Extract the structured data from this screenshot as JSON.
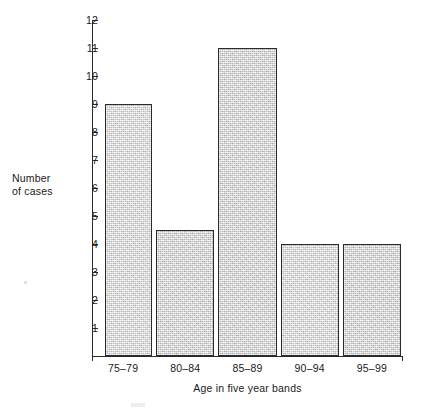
{
  "chart_data": {
    "type": "bar",
    "title": "",
    "subtitle": "",
    "xlabel": "Age in five year bands",
    "ylabel": "Number of cases",
    "ylabel_lines": [
      "Number",
      "of cases"
    ],
    "categories": [
      "75–79",
      "80–84",
      "85–89",
      "90–94",
      "95–99"
    ],
    "values": [
      9,
      4.5,
      11,
      4,
      4
    ],
    "ylim": [
      0,
      12
    ],
    "ytick_labels": [
      "1",
      "2",
      "3",
      "4",
      "5",
      "6",
      "7",
      "8",
      "9",
      "10",
      "11",
      "12"
    ],
    "ytick_values": [
      1,
      2,
      3,
      4,
      5,
      6,
      7,
      8,
      9,
      10,
      11,
      12
    ],
    "grid": false,
    "legend": null,
    "bar_fill_color": "#d2d2d2",
    "bar_border_color": "#2a2a2a",
    "axis_color": "#2b2b2b",
    "background_color": "#ffffff"
  },
  "figure": {
    "caption": ""
  }
}
